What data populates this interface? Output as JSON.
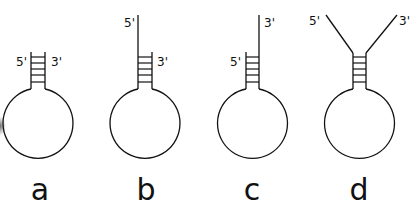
{
  "figure": {
    "panels": [
      {
        "id": "a",
        "label": "a",
        "five_prime": "5'",
        "three_prime": "3'",
        "stem_type": "blunt"
      },
      {
        "id": "b",
        "label": "b",
        "five_prime": "5'",
        "three_prime": "3'",
        "stem_type": "5'-overhang"
      },
      {
        "id": "c",
        "label": "c",
        "five_prime": "5'",
        "three_prime": "3'",
        "stem_type": "3'-overhang"
      },
      {
        "id": "d",
        "label": "d",
        "five_prime": "5'",
        "three_prime": "3'",
        "stem_type": "splayed-ends"
      }
    ]
  },
  "colors": {
    "line": "#111111",
    "background": "#ffffff"
  }
}
